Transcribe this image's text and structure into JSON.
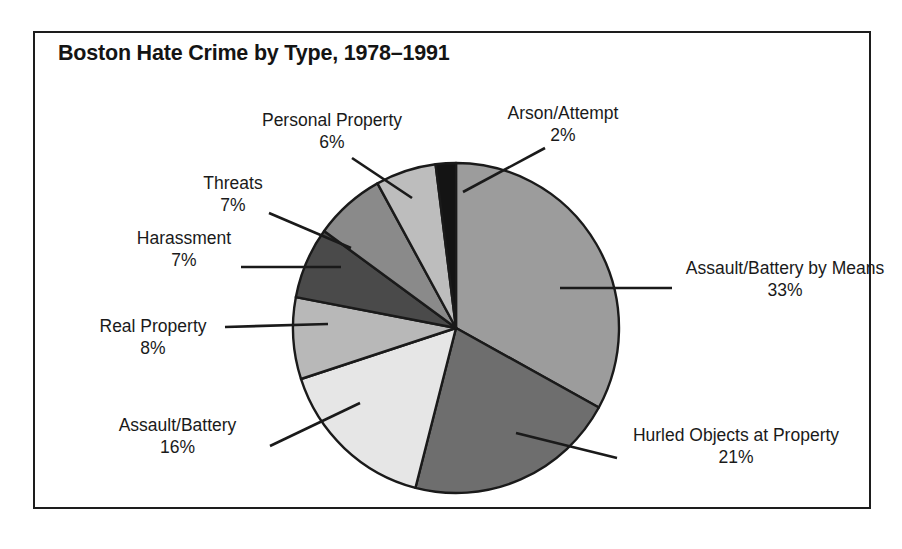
{
  "figure": {
    "title": "Boston Hate Crime by Type, 1978–1991",
    "frame_color": "#1d1d1d",
    "background": "#ffffff"
  },
  "chart_data": {
    "type": "pie",
    "title": "Boston Hate Crime by Type, 1978–1991",
    "xlabel": "",
    "ylabel": "",
    "unit": "percent",
    "legend_position": "none",
    "labels_style": "callout-leader-lines",
    "grid": false,
    "start_angle_deg": 0,
    "direction": "clockwise",
    "categories": [
      "Assault/Battery by Means",
      "Hurled Objects at Property",
      "Assault/Battery",
      "Real Property",
      "Harassment",
      "Threats",
      "Personal Property",
      "Arson/Attempt"
    ],
    "values": [
      33,
      21,
      16,
      8,
      7,
      7,
      6,
      2
    ],
    "value_labels": [
      "33%",
      "21%",
      "16%",
      "8%",
      "7%",
      "7%",
      "6%",
      "2%"
    ],
    "colors": [
      "#9c9c9c",
      "#6e6e6e",
      "#e6e6e6",
      "#b8b8b8",
      "#4a4a4a",
      "#8a8a8a",
      "#bdbdbd",
      "#141414"
    ],
    "slices": [
      {
        "label": "Assault/Battery by Means",
        "value": 33,
        "value_label": "33%",
        "color": "#9c9c9c"
      },
      {
        "label": "Hurled Objects at Property",
        "value": 21,
        "value_label": "21%",
        "color": "#6e6e6e"
      },
      {
        "label": "Assault/Battery",
        "value": 16,
        "value_label": "16%",
        "color": "#e6e6e6"
      },
      {
        "label": "Real Property",
        "value": 8,
        "value_label": "8%",
        "color": "#b8b8b8"
      },
      {
        "label": "Harassment",
        "value": 7,
        "value_label": "7%",
        "color": "#4a4a4a"
      },
      {
        "label": "Threats",
        "value": 7,
        "value_label": "7%",
        "color": "#8a8a8a"
      },
      {
        "label": "Personal Property",
        "value": 6,
        "value_label": "6%",
        "color": "#bdbdbd"
      },
      {
        "label": "Arson/Attempt",
        "value": 2,
        "value_label": "2%",
        "color": "#141414"
      }
    ]
  },
  "callouts": {
    "personal_property": {
      "name": "Personal Property",
      "pct": "6%"
    },
    "arson_attempt": {
      "name": "Arson/Attempt",
      "pct": "2%"
    },
    "threats": {
      "name": "Threats",
      "pct": "7%"
    },
    "harassment": {
      "name": "Harassment",
      "pct": "7%"
    },
    "real_property": {
      "name": "Real Property",
      "pct": "8%"
    },
    "assault_battery": {
      "name": "Assault/Battery",
      "pct": "16%"
    },
    "assault_battery_by_means": {
      "name": "Assault/Battery by Means",
      "pct": "33%"
    },
    "hurled_objects": {
      "name": "Hurled Objects at Property",
      "pct": "21%"
    }
  }
}
